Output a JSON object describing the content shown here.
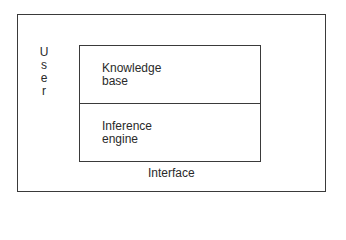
{
  "diagram": {
    "outer_box": {
      "label": "Interface"
    },
    "side_label": {
      "letters": [
        "U",
        "s",
        "e",
        "r"
      ],
      "text": "User"
    },
    "inner_box": {
      "top_section": {
        "line1": "Knowledge",
        "line2": "base"
      },
      "bottom_section": {
        "line1": "Inference",
        "line2": "engine"
      }
    },
    "colors": {
      "line": "#3a3a3a",
      "text": "#2a2a2a",
      "background": "#ffffff"
    }
  }
}
